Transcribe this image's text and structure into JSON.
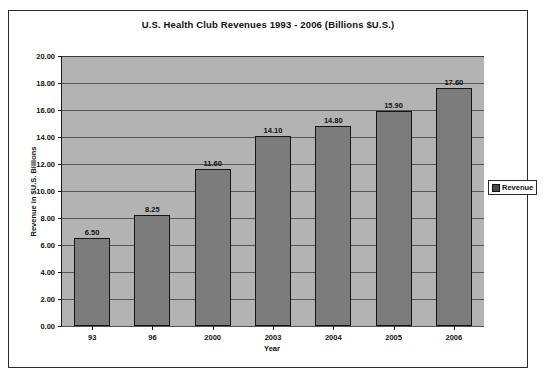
{
  "chart_data": {
    "type": "bar",
    "title": "U.S. Health Club Revenues 1993 - 2006 (Billions $U.S.)",
    "xlabel": "Year",
    "ylabel": "Revenue in $U.S. Billions",
    "categories": [
      "93",
      "96",
      "2000",
      "2003",
      "2004",
      "2005",
      "2006"
    ],
    "values": [
      6.5,
      8.25,
      11.6,
      14.1,
      14.8,
      15.9,
      17.6
    ],
    "value_labels": [
      "6.50",
      "8.25",
      "11.60",
      "14.10",
      "14.80",
      "15.90",
      "17.60"
    ],
    "series": [
      {
        "name": "Revenue",
        "values": [
          6.5,
          8.25,
          11.6,
          14.1,
          14.8,
          15.9,
          17.6
        ]
      }
    ],
    "ylim": [
      0,
      20
    ],
    "ytick_step": 2,
    "ytick_labels": [
      "0.00",
      "2.00",
      "4.00",
      "6.00",
      "8.00",
      "10.00",
      "12.00",
      "14.00",
      "16.00",
      "18.00",
      "20.00"
    ],
    "grid": true,
    "legend": {
      "position": "right",
      "entries": [
        "Revenue"
      ]
    },
    "colors": {
      "bar_fill": "#7c7c7c",
      "bar_border": "#141414",
      "plot_background": "#b3b3b3",
      "frame_border": "#2b2b2b",
      "text": "#111111",
      "gridline": "#555555",
      "legend_swatch": "#4a4a4a"
    }
  }
}
